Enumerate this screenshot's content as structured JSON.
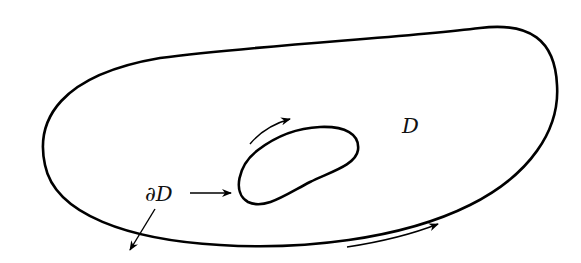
{
  "diagram": {
    "region_label": "D",
    "boundary_label": "∂D",
    "stroke_color": "#000000",
    "background": "#ffffff",
    "orientation": "counterclockwise outer boundary, clockwise inner boundary (region on left)"
  }
}
